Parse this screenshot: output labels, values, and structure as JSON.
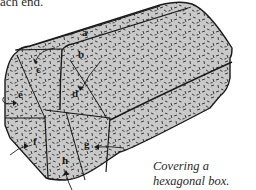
{
  "top_text": "ach end.",
  "caption": {
    "line1": "Covering a",
    "line2": "hexagonal box."
  },
  "labels": {
    "a": "a",
    "b": "b",
    "c": "c",
    "d": "d",
    "e": "e",
    "f": "f",
    "g": "g",
    "h": "h"
  },
  "colors": {
    "paper_fill": "#c9c9c9",
    "outline": "#1a1a1a",
    "speckle": "#2b2b2b"
  }
}
